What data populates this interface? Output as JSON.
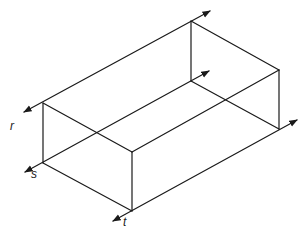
{
  "diagram": {
    "type": "isometric rectangular box with extended axis lines",
    "stroke_color": "#1a1a1a",
    "background": "#ffffff",
    "labels": {
      "r": "r",
      "s": "s",
      "t": "t"
    },
    "vertices": {
      "left_top": [
        43,
        103
      ],
      "left_bottom": [
        43,
        163
      ],
      "front_top": [
        132,
        152
      ],
      "front_bottom": [
        132,
        211
      ],
      "back_top": [
        191,
        21
      ],
      "back_inner": [
        191,
        81
      ],
      "right_top": [
        279,
        70
      ],
      "right_bottom": [
        279,
        129
      ]
    }
  }
}
